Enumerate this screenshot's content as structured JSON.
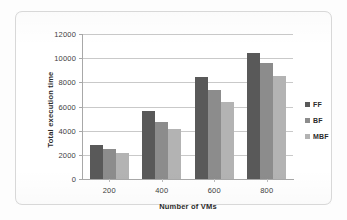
{
  "chart_data": {
    "type": "bar",
    "title": "",
    "xlabel": "Number of VMs",
    "ylabel": "Total execution time",
    "categories": [
      "200",
      "400",
      "600",
      "800"
    ],
    "series": [
      {
        "name": "FF",
        "color": "#595959",
        "values": [
          2800,
          5600,
          8450,
          10400
        ]
      },
      {
        "name": "BF",
        "color": "#8c8c8c",
        "values": [
          2450,
          4700,
          7400,
          9600
        ]
      },
      {
        "name": "MBF",
        "color": "#b3b3b3",
        "values": [
          2150,
          4150,
          6350,
          8550
        ]
      }
    ],
    "ylim": [
      0,
      12000
    ],
    "ytick_step": 2000,
    "yticks": [
      "12000",
      "10000",
      "8000",
      "6000",
      "4000",
      "2000",
      "0"
    ],
    "grid": true,
    "legend_position": "right"
  }
}
